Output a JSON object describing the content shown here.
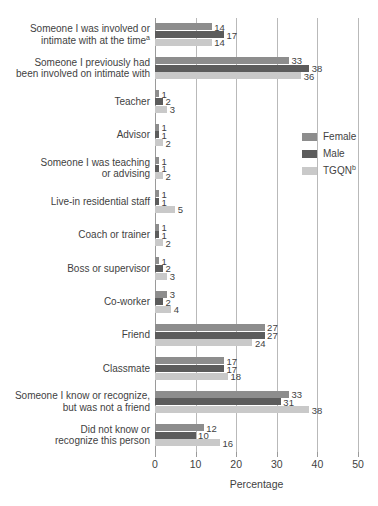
{
  "chart_data": {
    "type": "bar",
    "orientation": "horizontal",
    "title": "",
    "xlabel": "Percentage",
    "ylabel": "",
    "xlim": [
      0,
      50
    ],
    "xticks": [
      0,
      10,
      20,
      30,
      40,
      50
    ],
    "grid": true,
    "legend_position": "right-middle",
    "categories": [
      "Someone I was involved or intimate with at the time",
      "Someone I previously had been involved on intimate with",
      "Teacher",
      "Advisor",
      "Someone I was teaching or advising",
      "Live-in residential staff",
      "Coach or trainer",
      "Boss or supervisor",
      "Co-worker",
      "Friend",
      "Classmate",
      "Someone I know or recognize, but was not a friend",
      "Did not know or recognize this person"
    ],
    "category_labels": [
      "Someone I was involved or\nintimate with at the time",
      "Someone I previously had\nbeen involved on intimate with",
      "Teacher",
      "Advisor",
      "Someone I was teaching\nor advising",
      "Live-in residential staff",
      "Coach or trainer",
      "Boss or supervisor",
      "Co-worker",
      "Friend",
      "Classmate",
      "Someone I know or recognize,\nbut was not a friend",
      "Did not know or\nrecognize this person"
    ],
    "category_footnotes": [
      "a",
      "",
      "",
      "",
      "",
      "",
      "",
      "",
      "",
      "",
      "",
      "",
      ""
    ],
    "series": [
      {
        "name": "Female",
        "color": "#8d8d8d",
        "values": [
          14,
          33,
          1,
          1,
          1,
          1,
          1,
          1,
          3,
          27,
          17,
          33,
          12
        ]
      },
      {
        "name": "Male",
        "color": "#5c5c5c",
        "values": [
          17,
          38,
          2,
          1,
          1,
          1,
          1,
          2,
          2,
          27,
          17,
          31,
          10
        ]
      },
      {
        "name": "TGQN",
        "color": "#c9c9c9",
        "footnote": "b",
        "values": [
          14,
          36,
          3,
          2,
          2,
          5,
          2,
          3,
          4,
          24,
          18,
          38,
          16
        ]
      }
    ]
  },
  "axis": {
    "x_title": "Percentage",
    "x_tick_labels": [
      "0",
      "10",
      "20",
      "30",
      "40",
      "50"
    ]
  },
  "legend": {
    "items": [
      {
        "label": "Female",
        "footnote": ""
      },
      {
        "label": "Male",
        "footnote": ""
      },
      {
        "label": "TGQN",
        "footnote": "b"
      }
    ]
  }
}
